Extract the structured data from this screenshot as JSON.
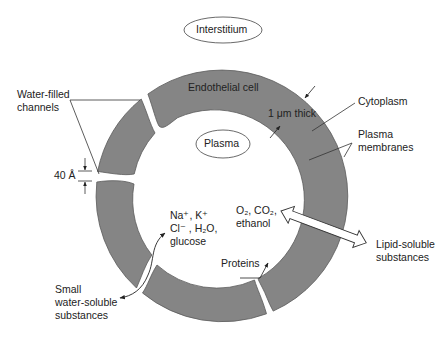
{
  "diagram": {
    "compartments": {
      "outer": "Interstitium",
      "inner": "Plasma"
    },
    "structures": {
      "endothelial_cell": "Endothelial cell",
      "thickness": "1 μm thick",
      "cytoplasm": "Cytoplasm",
      "membranes_line1": "Plasma",
      "membranes_line2": "membranes",
      "channels_line1": "Water-filled",
      "channels_line2": "channels",
      "gap_width": "40 Å"
    },
    "water_soluble": {
      "ions_line1": "Na⁺, K⁺",
      "ions_line2": "Cl⁻ , H₂O,",
      "ions_line3": "glucose",
      "label_line1": "Small",
      "label_line2": "water-soluble",
      "label_line3": "substances"
    },
    "lipid_soluble": {
      "gases_line1": "O₂, CO₂,",
      "gases_line2": "ethanol",
      "label_line1": "Lipid-soluble",
      "label_line2": "substances"
    },
    "proteins": "Proteins",
    "colors": {
      "cell_fill": "#858585",
      "cell_stroke": "#5a5a5a",
      "line": "#333333",
      "background": "#ffffff"
    }
  }
}
